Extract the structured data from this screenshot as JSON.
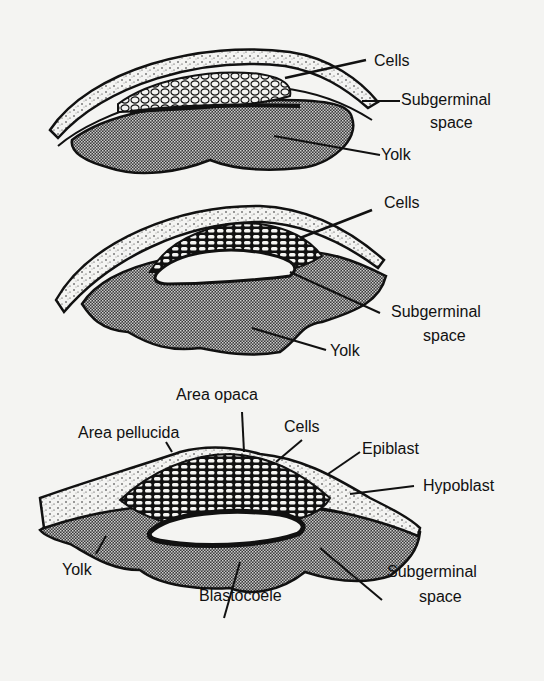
{
  "figure": {
    "background": "#f4f4f2",
    "ink": "#111111",
    "stages": [
      {
        "id": "stage-1",
        "labels": {
          "cells": "Cells",
          "subgerminal_line1": "Subgerminal",
          "subgerminal_line2": "space",
          "yolk": "Yolk"
        }
      },
      {
        "id": "stage-2",
        "labels": {
          "cells": "Cells",
          "subgerminal_line1": "Subgerminal",
          "subgerminal_line2": "space",
          "yolk": "Yolk"
        }
      },
      {
        "id": "stage-3",
        "labels": {
          "area_opaca": "Area opaca",
          "area_pellucida": "Area pellucida",
          "cells": "Cells",
          "epiblast": "Epiblast",
          "hypoblast": "Hypoblast",
          "yolk": "Yolk",
          "blastocoele": "Blastocoele",
          "subgerminal_line1": "Subgerminal",
          "subgerminal_line2": "space"
        }
      }
    ]
  }
}
